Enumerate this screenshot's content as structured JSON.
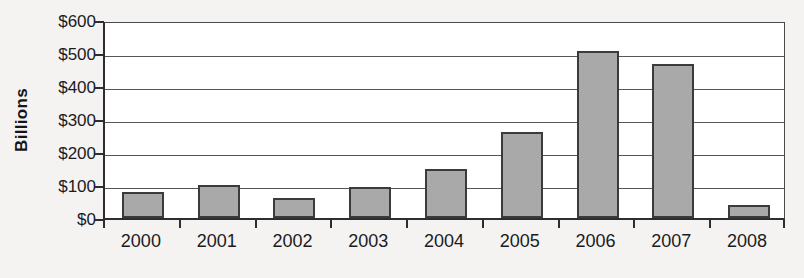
{
  "chart_data": {
    "type": "bar",
    "title": "",
    "subtitle": "",
    "xlabel": "",
    "ylabel": "Billions",
    "categories": [
      "2000",
      "2001",
      "2002",
      "2003",
      "2004",
      "2005",
      "2006",
      "2007",
      "2008"
    ],
    "values": [
      80,
      100,
      60,
      95,
      150,
      262,
      505,
      468,
      40
    ],
    "ylim": [
      0,
      600
    ],
    "ytick_values": [
      0,
      100,
      200,
      300,
      400,
      500,
      600
    ],
    "ytick_labels": [
      "$0",
      "$100",
      "$200",
      "$300",
      "$400",
      "$500",
      "$600"
    ],
    "y_tick_step": 100,
    "value_prefix": "$",
    "grid": true,
    "grid_axis": "y",
    "legend": false,
    "legend_position": "none",
    "series": [
      {
        "name": "Amount",
        "values": [
          80,
          100,
          60,
          95,
          150,
          262,
          505,
          468,
          40
        ]
      }
    ],
    "colors": {
      "bar_fill": "#a9a9a9",
      "bar_border": "#3b3b3f",
      "gridline": "#55555a",
      "axis": "#2e2e32",
      "plot_background": "#ffffff",
      "page_background": "#f4f3f1",
      "text": "#1b1b1f"
    }
  }
}
